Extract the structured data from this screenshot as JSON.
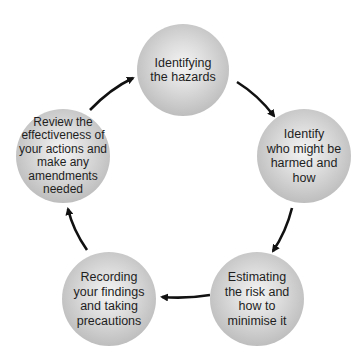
{
  "diagram": {
    "type": "cycle",
    "colors": {
      "node_fill": "#c8c8c8",
      "node_highlight": "#f4f4f4",
      "arrow": "#111111",
      "text": "#1e1e1e"
    },
    "nodes": [
      {
        "id": "identify-hazards",
        "label": "Identifying\nthe hazards",
        "cx": 183,
        "cy": 70,
        "r": 46
      },
      {
        "id": "identify-who",
        "label": "Identify\nwho might be\nharmed and\nhow",
        "cx": 304,
        "cy": 156,
        "r": 47
      },
      {
        "id": "estimate-risk",
        "label": "Estimating\nthe risk and\nhow to\nminimise it",
        "cx": 257,
        "cy": 299,
        "r": 47
      },
      {
        "id": "record-findings",
        "label": "Recording\nyour findings\nand taking\nprecautions",
        "cx": 109,
        "cy": 299,
        "r": 47
      },
      {
        "id": "review",
        "label": "Review the\neffectiveness of\nyour actions and\nmake any\namendments\nneeded",
        "cx": 63,
        "cy": 156,
        "r": 47
      }
    ],
    "edges": [
      {
        "from": "identify-hazards",
        "to": "identify-who"
      },
      {
        "from": "identify-who",
        "to": "estimate-risk"
      },
      {
        "from": "estimate-risk",
        "to": "record-findings"
      },
      {
        "from": "record-findings",
        "to": "review"
      },
      {
        "from": "review",
        "to": "identify-hazards"
      }
    ]
  }
}
